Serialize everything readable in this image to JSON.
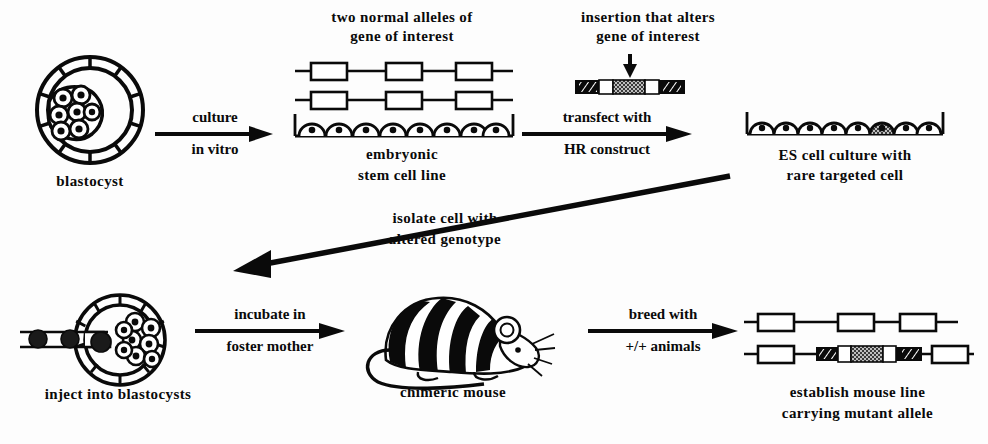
{
  "figure": {
    "background_color": "#fdfdfd",
    "ink_color": "#0a0a0a"
  },
  "labels": {
    "blastocyst": "blastocyst",
    "two_normal_alleles_line1": "two normal alleles of",
    "two_normal_alleles_line2": "gene of interest",
    "embryonic_stem_line1": "embryonic",
    "embryonic_stem_line2": "stem cell line",
    "insertion_line1": "insertion that alters",
    "insertion_line2": "gene of interest",
    "es_culture_line1": "ES cell culture with",
    "es_culture_line2": "rare targeted cell",
    "isolate_line1": "isolate cell with",
    "isolate_line2": "altered genotype",
    "inject_into_blastocysts": "inject into blastocysts",
    "chimeric_mouse": "chimeric mouse",
    "establish_line1": "establish mouse line",
    "establish_line2": "carrying mutant allele"
  },
  "arrows": {
    "culture": {
      "top": "culture",
      "bottom": "in  vitro",
      "direction": "right"
    },
    "transfect": {
      "top": "transfect  with",
      "bottom": "HR  construct",
      "direction": "right"
    },
    "isolate": {
      "direction": "down-left"
    },
    "incubate": {
      "top": "incubate in",
      "bottom": "foster  mother",
      "direction": "right"
    },
    "breed": {
      "top": "breed with",
      "bottom": "+/+  animals",
      "direction": "right"
    }
  },
  "diagrams": {
    "blastocyst_top": {
      "name": "blastocyst",
      "trophoblast_segments": 10,
      "inner_cell_mass_cells": 7,
      "icm_side": "left"
    },
    "normal_alleles": {
      "allele_count": 2,
      "exon_boxes_per_allele": 3,
      "box_fill": "white",
      "box_stroke": "#0a0a0a"
    },
    "es_cell_line": {
      "cell_count": 8,
      "targeted_cell_index": null,
      "targeted": false
    },
    "hr_construct": {
      "segments": [
        "hatched-arm",
        "white-box",
        "stippled-insert",
        "white-box",
        "hatched-arm"
      ],
      "insertion_arrow": "down"
    },
    "es_culture_targeted": {
      "cell_count": 8,
      "targeted_cell_index": 6,
      "targeted": true,
      "targeted_fill": "stippled"
    },
    "blastocyst_injected": {
      "name": "injected blastocyst",
      "trophoblast_segments": 10,
      "inner_cell_mass_cells": 8,
      "icm_side": "right",
      "pipette_cells": 3,
      "pipette_side": "left"
    },
    "chimeric_mouse": {
      "coat": "white with black stripes",
      "stripe_count": 4
    },
    "mutant_alleles": {
      "allele_count": 2,
      "top_allele_boxes": 3,
      "bottom_allele": [
        "white-box",
        "hatched-arm",
        "white-box",
        "stippled-insert",
        "white-box",
        "hatched-arm",
        "white-box"
      ]
    }
  }
}
